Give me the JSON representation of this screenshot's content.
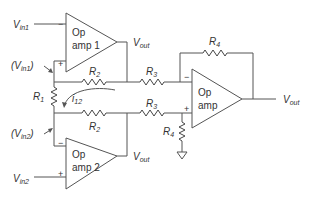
{
  "inputs": {
    "vin1": {
      "main": "V",
      "sub": "in1"
    },
    "vin2": {
      "main": "V",
      "sub": "in2"
    },
    "vin1_node": {
      "open": "(V",
      "sub": "in1",
      "close": ")"
    },
    "vin2_node": {
      "open": "(V",
      "sub": "in2",
      "close": ")"
    }
  },
  "opamps": [
    {
      "line1": "Op",
      "line2": "amp 1",
      "minus": "−",
      "plus": "+",
      "out": {
        "main": "V",
        "sub": "out"
      }
    },
    {
      "line1": "Op",
      "line2": "amp 2",
      "minus": "−",
      "plus": "+",
      "out": {
        "main": "V",
        "sub": "out"
      }
    },
    {
      "line1": "Op",
      "line2": "amp",
      "minus": "−",
      "plus": "+",
      "out": {
        "main": "V",
        "sub": "out"
      }
    }
  ],
  "resistors": {
    "r1": {
      "main": "R",
      "sub": "1"
    },
    "r2_top": {
      "main": "R",
      "sub": "2"
    },
    "r2_bottom": {
      "main": "R",
      "sub": "2"
    },
    "r3_top": {
      "main": "R",
      "sub": "3"
    },
    "r3_bottom": {
      "main": "R",
      "sub": "3"
    },
    "r4_feedback": {
      "main": "R",
      "sub": "4"
    },
    "r4_ground": {
      "main": "R",
      "sub": "4"
    }
  },
  "current": {
    "main": "i",
    "sub": "12"
  },
  "colors": {
    "line": "#555555",
    "text": "#333333",
    "background": "#ffffff"
  }
}
